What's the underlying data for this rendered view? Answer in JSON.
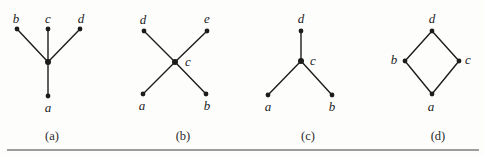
{
  "figure": {
    "background": "#fdfdfb",
    "stroke_color": "#1c1c1c",
    "edge_width": 1.4,
    "dot_radius": 2.4,
    "center_dot_radius": 3,
    "rule": {
      "x1": 7,
      "y1": 150,
      "x2": 479,
      "y2": 150,
      "width": 1.4,
      "color": "#7d7d7d"
    },
    "graphs": [
      {
        "caption": "(a)",
        "caption_x": 52,
        "caption_y": 136,
        "vertices": [
          {
            "id": "b",
            "x": 17,
            "y": 29,
            "label": "b",
            "lx": 16,
            "ly": 18
          },
          {
            "id": "c",
            "x": 48,
            "y": 29,
            "label": "c",
            "lx": 48,
            "ly": 18
          },
          {
            "id": "d",
            "x": 80,
            "y": 29,
            "label": "d",
            "lx": 81,
            "ly": 18
          },
          {
            "id": "m",
            "x": 48,
            "y": 62,
            "label": null,
            "center": true
          },
          {
            "id": "a",
            "x": 48,
            "y": 96,
            "label": "a",
            "lx": 48,
            "ly": 107
          }
        ],
        "edges": [
          [
            "b",
            "m"
          ],
          [
            "c",
            "m"
          ],
          [
            "d",
            "m"
          ],
          [
            "m",
            "a"
          ]
        ]
      },
      {
        "caption": "(b)",
        "caption_x": 183,
        "caption_y": 136,
        "vertices": [
          {
            "id": "d",
            "x": 144,
            "y": 31,
            "label": "d",
            "lx": 143,
            "ly": 19
          },
          {
            "id": "e",
            "x": 207,
            "y": 31,
            "label": "e",
            "lx": 207,
            "ly": 18
          },
          {
            "id": "c",
            "x": 175,
            "y": 62,
            "label": "c",
            "lx": 188,
            "ly": 61,
            "center": true
          },
          {
            "id": "a",
            "x": 143,
            "y": 94,
            "label": "a",
            "lx": 142,
            "ly": 105
          },
          {
            "id": "b",
            "x": 206,
            "y": 94,
            "label": "b",
            "lx": 207,
            "ly": 105
          }
        ],
        "edges": [
          [
            "d",
            "c"
          ],
          [
            "e",
            "c"
          ],
          [
            "a",
            "c"
          ],
          [
            "b",
            "c"
          ]
        ]
      },
      {
        "caption": "(c)",
        "caption_x": 308,
        "caption_y": 136,
        "vertices": [
          {
            "id": "d",
            "x": 301,
            "y": 31,
            "label": "d",
            "lx": 301,
            "ly": 18
          },
          {
            "id": "c",
            "x": 301,
            "y": 61,
            "label": "c",
            "lx": 313,
            "ly": 60,
            "center": true
          },
          {
            "id": "a",
            "x": 268,
            "y": 95,
            "label": "a",
            "lx": 268,
            "ly": 106
          },
          {
            "id": "b",
            "x": 332,
            "y": 95,
            "label": "b",
            "lx": 332,
            "ly": 106
          }
        ],
        "edges": [
          [
            "d",
            "c"
          ],
          [
            "a",
            "c"
          ],
          [
            "b",
            "c"
          ]
        ]
      },
      {
        "caption": "(d)",
        "caption_x": 438,
        "caption_y": 136,
        "vertices": [
          {
            "id": "d",
            "x": 432,
            "y": 31,
            "label": "d",
            "lx": 432,
            "ly": 18
          },
          {
            "id": "b",
            "x": 405,
            "y": 61,
            "label": "b",
            "lx": 394,
            "ly": 59
          },
          {
            "id": "c",
            "x": 459,
            "y": 61,
            "label": "c",
            "lx": 468,
            "ly": 59
          },
          {
            "id": "a",
            "x": 432,
            "y": 94,
            "label": "a",
            "lx": 431,
            "ly": 106
          }
        ],
        "edges": [
          [
            "d",
            "b"
          ],
          [
            "d",
            "c"
          ],
          [
            "b",
            "a"
          ],
          [
            "c",
            "a"
          ]
        ]
      }
    ]
  }
}
